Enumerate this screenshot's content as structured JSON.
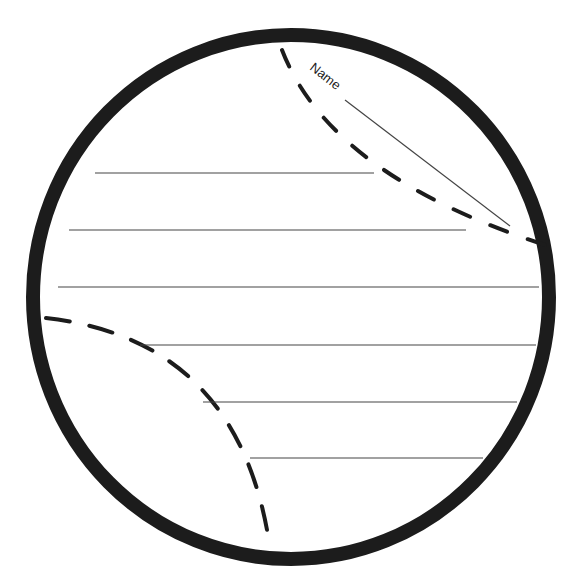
{
  "worksheet": {
    "name_label": "Name",
    "writing_lines": [
      {
        "x1": 95,
        "x2": 374,
        "y": 173
      },
      {
        "x1": 69,
        "x2": 466,
        "y": 230
      },
      {
        "x1": 58,
        "x2": 539,
        "y": 287
      },
      {
        "x1": 140,
        "x2": 536,
        "y": 345
      },
      {
        "x1": 203,
        "x2": 517,
        "y": 402
      },
      {
        "x1": 250,
        "x2": 483,
        "y": 458
      }
    ],
    "colors": {
      "outline": "#1c1c1c",
      "line": "#444444",
      "background": "#ffffff"
    }
  }
}
